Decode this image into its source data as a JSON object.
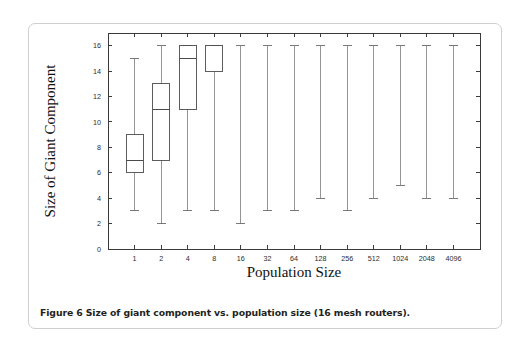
{
  "figure": {
    "caption": "Figure 6 Size of giant component vs. population size (16 mesh routers)."
  },
  "chart_data": {
    "type": "box",
    "title": "",
    "xlabel": "Population Size",
    "ylabel": "Size of Giant Component",
    "categories": [
      "1",
      "2",
      "4",
      "8",
      "16",
      "32",
      "64",
      "128",
      "256",
      "512",
      "1024",
      "2048",
      "4096"
    ],
    "x_tick_labels": [
      "1",
      "2",
      "4",
      "8",
      "16",
      "32",
      "64",
      "128",
      "256",
      "512",
      "1024",
      "2048",
      "4096"
    ],
    "y_tick_labels": [
      "0",
      "2",
      "4",
      "6",
      "8",
      "10",
      "12",
      "14",
      "16"
    ],
    "y_ticks": [
      0,
      2,
      4,
      6,
      8,
      10,
      12,
      14,
      16
    ],
    "ylim": [
      0,
      17
    ],
    "grid": false,
    "legend": null,
    "boxes": [
      {
        "category": "1",
        "whisker_low": 3,
        "q1": 6,
        "median": 7,
        "q3": 9,
        "whisker_high": 15
      },
      {
        "category": "2",
        "whisker_low": 2,
        "q1": 7,
        "median": 11,
        "q3": 13,
        "whisker_high": 16
      },
      {
        "category": "4",
        "whisker_low": 3,
        "q1": 11,
        "median": 15,
        "q3": 16,
        "whisker_high": 16
      },
      {
        "category": "8",
        "whisker_low": 3,
        "q1": 14,
        "median": 16,
        "q3": 16,
        "whisker_high": 16
      },
      {
        "category": "16",
        "whisker_low": 2,
        "q1": 16,
        "median": 16,
        "q3": 16,
        "whisker_high": 16
      },
      {
        "category": "32",
        "whisker_low": 3,
        "q1": 16,
        "median": 16,
        "q3": 16,
        "whisker_high": 16
      },
      {
        "category": "64",
        "whisker_low": 3,
        "q1": 16,
        "median": 16,
        "q3": 16,
        "whisker_high": 16
      },
      {
        "category": "128",
        "whisker_low": 4,
        "q1": 16,
        "median": 16,
        "q3": 16,
        "whisker_high": 16
      },
      {
        "category": "256",
        "whisker_low": 3,
        "q1": 16,
        "median": 16,
        "q3": 16,
        "whisker_high": 16
      },
      {
        "category": "512",
        "whisker_low": 4,
        "q1": 16,
        "median": 16,
        "q3": 16,
        "whisker_high": 16
      },
      {
        "category": "1024",
        "whisker_low": 5,
        "q1": 16,
        "median": 16,
        "q3": 16,
        "whisker_high": 16
      },
      {
        "category": "2048",
        "whisker_low": 4,
        "q1": 16,
        "median": 16,
        "q3": 16,
        "whisker_high": 16
      },
      {
        "category": "4096",
        "whisker_low": 4,
        "q1": 16,
        "median": 16,
        "q3": 16,
        "whisker_high": 16
      }
    ]
  }
}
